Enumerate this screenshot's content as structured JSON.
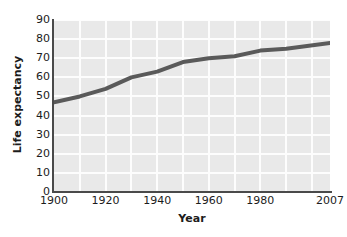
{
  "chart_data": {
    "type": "line",
    "title": "",
    "xlabel": "Year",
    "ylabel": "Life expectancy",
    "x": [
      1900,
      1910,
      1920,
      1930,
      1940,
      1950,
      1960,
      1970,
      1980,
      1990,
      2007
    ],
    "values": [
      47,
      50,
      54,
      60,
      63,
      68,
      70,
      71,
      74,
      75,
      78
    ],
    "series": [
      {
        "name": "Life expectancy",
        "values": [
          47,
          50,
          54,
          60,
          63,
          68,
          70,
          71,
          74,
          75,
          78
        ]
      }
    ],
    "xlim": [
      1900,
      2007
    ],
    "ylim": [
      0,
      90
    ],
    "xticks": [
      1900,
      1920,
      1940,
      1960,
      1980,
      2007
    ],
    "xtick_labels": [
      "1900",
      "1920",
      "1940",
      "1960",
      "1980",
      "2007"
    ],
    "yticks": [
      0,
      10,
      20,
      30,
      40,
      50,
      60,
      70,
      80,
      90
    ],
    "ytick_labels": [
      "0",
      "10",
      "20",
      "30",
      "40",
      "50",
      "60",
      "70",
      "80",
      "90"
    ],
    "grid": true,
    "legend": false,
    "legend_position": "none",
    "line_color": "#5a5a5a",
    "plot_background": "#e9e9e9",
    "gridline_color": "#fdfdfd",
    "axis_color": "#4a4a4a"
  }
}
